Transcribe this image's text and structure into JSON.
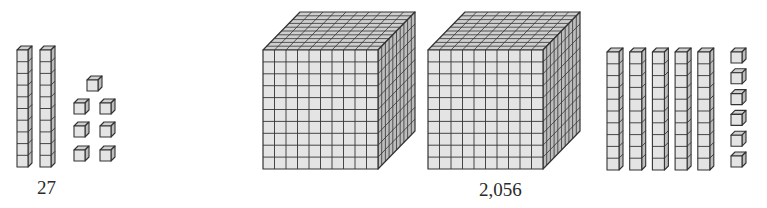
{
  "diagram": {
    "type": "base-ten-blocks",
    "colors": {
      "face_front": "#e4e4e4",
      "face_top": "#cfcfcf",
      "face_side": "#bdbdbd",
      "stroke": "#333333",
      "text": "#2a2a2a"
    },
    "groups": [
      {
        "name": "group-27",
        "label": "27",
        "label_pos": {
          "x": 37,
          "y": 178
        },
        "hundreds_flats": 0,
        "thousands_cubes": 0,
        "tens_rods": 2,
        "ones_units": 7
      },
      {
        "name": "group-2056",
        "label": "2,056",
        "label_pos": {
          "x": 479,
          "y": 180
        },
        "thousands_cubes": 2,
        "hundreds_flats": 0,
        "tens_rods": 5,
        "ones_units": 6
      }
    ]
  },
  "labels": {
    "left": "27",
    "right": "2,056"
  }
}
